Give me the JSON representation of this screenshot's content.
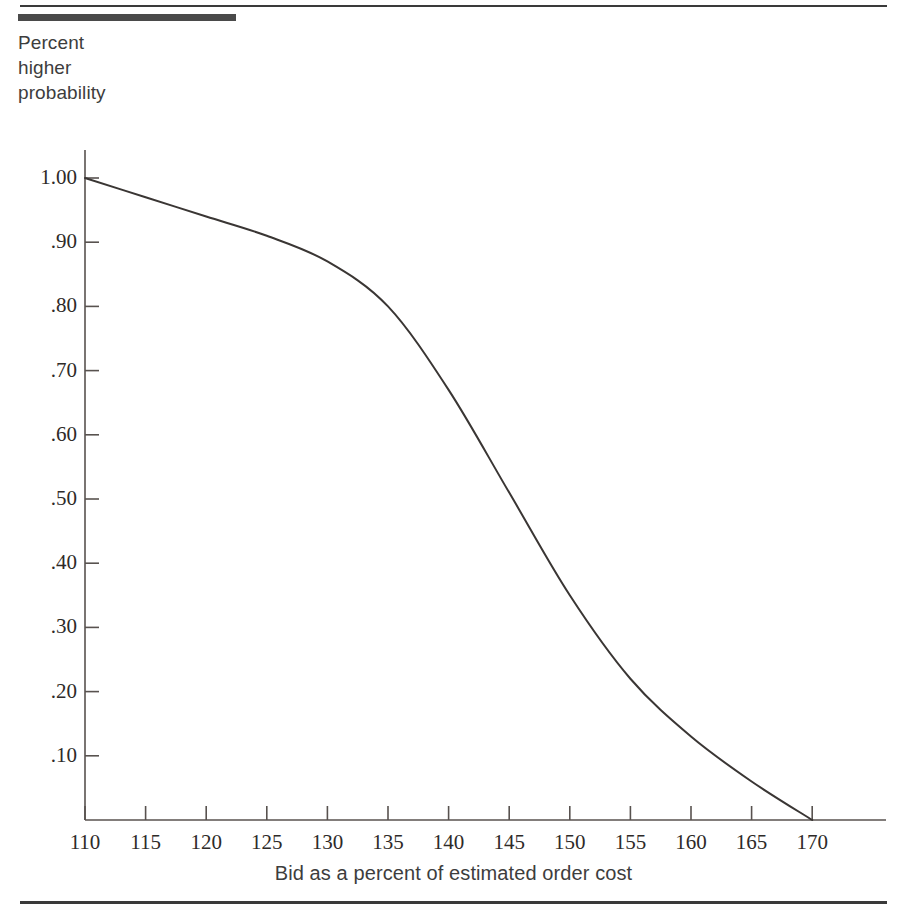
{
  "figure": {
    "top_rule": "decorative-rule",
    "bottom_rule": "decorative-rule",
    "accent_color": "#4a4a4a",
    "line_color": "#3a3634",
    "background": "#ffffff"
  },
  "axis_caption": {
    "y_lines": [
      "Percent",
      "higher",
      "probability"
    ],
    "x_title": "Bid as a percent of estimated order cost"
  },
  "chart_data": {
    "type": "line",
    "title": "",
    "subtitle": "",
    "xlabel": "Bid as a percent of estimated order cost",
    "ylabel": "Percent higher probability",
    "xlim": [
      110,
      175
    ],
    "ylim": [
      0.0,
      1.0
    ],
    "grid": false,
    "legend": null,
    "xticks": [
      110,
      115,
      120,
      125,
      130,
      135,
      140,
      145,
      150,
      155,
      160,
      165,
      170
    ],
    "xtick_labels": [
      "110",
      "115",
      "120",
      "125",
      "130",
      "135",
      "140",
      "145",
      "150",
      "155",
      "160",
      "165",
      "170"
    ],
    "yticks": [
      1.0,
      0.9,
      0.8,
      0.7,
      0.6,
      0.5,
      0.4,
      0.3,
      0.2,
      0.1
    ],
    "ytick_labels": [
      "1.00",
      ".90",
      ".80",
      ".70",
      ".60",
      ".50",
      ".40",
      ".30",
      ".20",
      ".10"
    ],
    "series": [
      {
        "name": "Probability of higher bid",
        "x": [
          110,
          115,
          120,
          125,
          130,
          135,
          140,
          145,
          150,
          155,
          160,
          165,
          170
        ],
        "values": [
          1.0,
          0.97,
          0.94,
          0.91,
          0.87,
          0.8,
          0.67,
          0.51,
          0.35,
          0.22,
          0.13,
          0.06,
          0.0
        ]
      }
    ]
  }
}
